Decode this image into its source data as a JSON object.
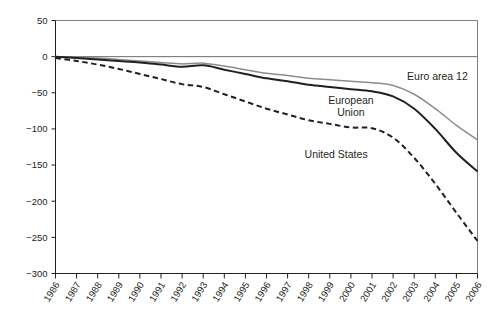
{
  "chart_data": {
    "type": "line",
    "title": "",
    "subtitle": "",
    "xlabel": "",
    "ylabel": "",
    "grid": false,
    "legend_position": "inline-annotations",
    "xlim": [
      1986,
      2006
    ],
    "ylim": [
      -300,
      50
    ],
    "yticks": [
      50,
      0,
      -50,
      -100,
      -150,
      -200,
      -250,
      -300
    ],
    "ytick_labels": [
      "50",
      "0",
      "−50",
      "−100",
      "−150",
      "−200",
      "−250",
      "−300"
    ],
    "categories": [
      "1986",
      "1987",
      "1988",
      "1989",
      "1990",
      "1991",
      "1992",
      "1993",
      "1994",
      "1995",
      "1996",
      "1997",
      "1998",
      "1999",
      "2000",
      "2001",
      "2002",
      "2003",
      "2004",
      "2005",
      "2006"
    ],
    "series": [
      {
        "name": "Euro area 12",
        "style": "solid",
        "color": "#8a8c8e",
        "values": [
          0,
          -1,
          -2,
          -4,
          -6,
          -8,
          -10,
          -9,
          -13,
          -18,
          -23,
          -26,
          -30,
          -32,
          -34,
          -36,
          -40,
          -52,
          -72,
          -95,
          -115
        ]
      },
      {
        "name": "European Union",
        "style": "solid",
        "color": "#231f20",
        "values": [
          0,
          -2,
          -4,
          -6,
          -8,
          -11,
          -14,
          -12,
          -18,
          -24,
          -30,
          -34,
          -39,
          -42,
          -45,
          -48,
          -55,
          -72,
          -100,
          -133,
          -159
        ]
      },
      {
        "name": "United States",
        "style": "dashed",
        "color": "#231f20",
        "values": [
          -2,
          -6,
          -11,
          -17,
          -24,
          -31,
          -38,
          -42,
          -52,
          -62,
          -72,
          -80,
          -88,
          -93,
          -98,
          -99,
          -112,
          -140,
          -176,
          -216,
          -255
        ]
      }
    ],
    "annotations": [
      {
        "text": "Euro area 12",
        "x": 2004.1,
        "y": -33
      },
      {
        "text": "European",
        "x": 2000.0,
        "y": -66
      },
      {
        "text": "Union",
        "x": 2000.0,
        "y": -82
      },
      {
        "text": "United States",
        "x": 1999.3,
        "y": -140
      }
    ]
  },
  "colors": {
    "axis": "#231f20",
    "frame": "#6d6e71",
    "euro_area": "#8a8c8e",
    "european_union": "#231f20",
    "united_states": "#231f20",
    "background": "#ffffff"
  }
}
